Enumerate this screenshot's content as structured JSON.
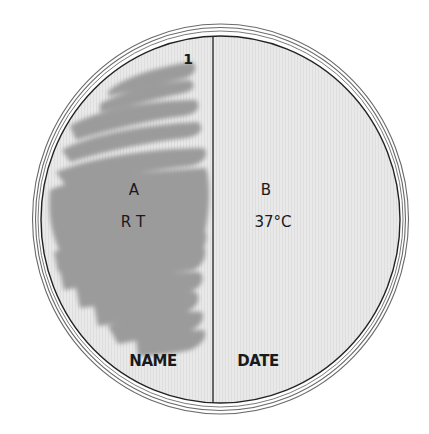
{
  "diagram": {
    "colors": {
      "background": "#ffffff",
      "agar": "#e8e8e8",
      "agar_stripe": "#dcdcdc",
      "growth_streak": "#9b9b9b",
      "outline": "#222222",
      "rim_line": "#555555"
    },
    "streak_number": "1",
    "left_half": {
      "section_label": "A",
      "condition_label": "R T",
      "footer_label": "NAME"
    },
    "right_half": {
      "section_label": "B",
      "condition_label": "37°C",
      "footer_label": "DATE"
    }
  }
}
